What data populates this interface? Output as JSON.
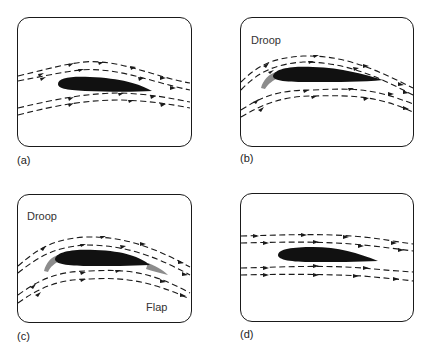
{
  "figure": {
    "panels": [
      {
        "id": "a",
        "caption": "(a)",
        "labels": []
      },
      {
        "id": "b",
        "caption": "(b)",
        "labels": [
          "Droop"
        ]
      },
      {
        "id": "c",
        "caption": "(c)",
        "labels": [
          "Droop",
          "Flap"
        ]
      },
      {
        "id": "d",
        "caption": "(d)",
        "labels": []
      }
    ],
    "colors": {
      "airfoil": "#111111",
      "droop_flap": "#8c8c8c",
      "streamline": "#1a1a1a",
      "frame": "#1a1a1a"
    }
  }
}
